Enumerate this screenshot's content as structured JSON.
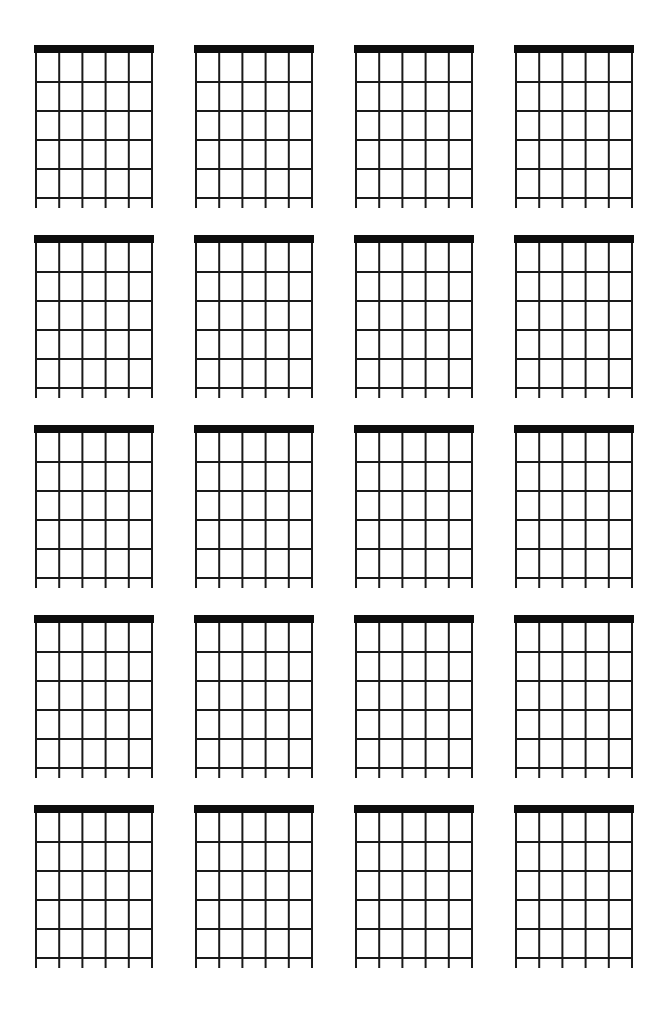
{
  "document": {
    "title": "Blank Guitar Chord Chart Sheet",
    "page_background": "#ffffff",
    "ink_color": "#1a1a1a",
    "nut_color": "#0d0d0d",
    "width_px": 668,
    "height_px": 1015
  },
  "sheet": {
    "type": "blank-chord-chart-worksheet",
    "diagram_count": 20,
    "columns": 4,
    "rows": 5,
    "diagrams": [
      {
        "index": 1,
        "row": 1,
        "column": 1,
        "label": "",
        "strings": 6,
        "frets": 5,
        "has_nut": true,
        "markers": []
      },
      {
        "index": 2,
        "row": 1,
        "column": 2,
        "label": "",
        "strings": 6,
        "frets": 5,
        "has_nut": true,
        "markers": []
      },
      {
        "index": 3,
        "row": 1,
        "column": 3,
        "label": "",
        "strings": 6,
        "frets": 5,
        "has_nut": true,
        "markers": []
      },
      {
        "index": 4,
        "row": 1,
        "column": 4,
        "label": "",
        "strings": 6,
        "frets": 5,
        "has_nut": true,
        "markers": []
      },
      {
        "index": 5,
        "row": 2,
        "column": 1,
        "label": "",
        "strings": 6,
        "frets": 5,
        "has_nut": true,
        "markers": []
      },
      {
        "index": 6,
        "row": 2,
        "column": 2,
        "label": "",
        "strings": 6,
        "frets": 5,
        "has_nut": true,
        "markers": []
      },
      {
        "index": 7,
        "row": 2,
        "column": 3,
        "label": "",
        "strings": 6,
        "frets": 5,
        "has_nut": true,
        "markers": []
      },
      {
        "index": 8,
        "row": 2,
        "column": 4,
        "label": "",
        "strings": 6,
        "frets": 5,
        "has_nut": true,
        "markers": []
      },
      {
        "index": 9,
        "row": 3,
        "column": 1,
        "label": "",
        "strings": 6,
        "frets": 5,
        "has_nut": true,
        "markers": []
      },
      {
        "index": 10,
        "row": 3,
        "column": 2,
        "label": "",
        "strings": 6,
        "frets": 5,
        "has_nut": true,
        "markers": []
      },
      {
        "index": 11,
        "row": 3,
        "column": 3,
        "label": "",
        "strings": 6,
        "frets": 5,
        "has_nut": true,
        "markers": []
      },
      {
        "index": 12,
        "row": 3,
        "column": 4,
        "label": "",
        "strings": 6,
        "frets": 5,
        "has_nut": true,
        "markers": []
      },
      {
        "index": 13,
        "row": 4,
        "column": 1,
        "label": "",
        "strings": 6,
        "frets": 5,
        "has_nut": true,
        "markers": []
      },
      {
        "index": 14,
        "row": 4,
        "column": 2,
        "label": "",
        "strings": 6,
        "frets": 5,
        "has_nut": true,
        "markers": []
      },
      {
        "index": 15,
        "row": 4,
        "column": 3,
        "label": "",
        "strings": 6,
        "frets": 5,
        "has_nut": true,
        "markers": []
      },
      {
        "index": 16,
        "row": 4,
        "column": 4,
        "label": "",
        "strings": 6,
        "frets": 5,
        "has_nut": true,
        "markers": []
      },
      {
        "index": 17,
        "row": 5,
        "column": 1,
        "label": "",
        "strings": 6,
        "frets": 5,
        "has_nut": true,
        "markers": []
      },
      {
        "index": 18,
        "row": 5,
        "column": 2,
        "label": "",
        "strings": 6,
        "frets": 5,
        "has_nut": true,
        "markers": []
      },
      {
        "index": 19,
        "row": 5,
        "column": 3,
        "label": "",
        "strings": 6,
        "frets": 5,
        "has_nut": true,
        "markers": []
      },
      {
        "index": 20,
        "row": 5,
        "column": 4,
        "label": "",
        "strings": 6,
        "frets": 5,
        "has_nut": true,
        "markers": []
      }
    ]
  }
}
